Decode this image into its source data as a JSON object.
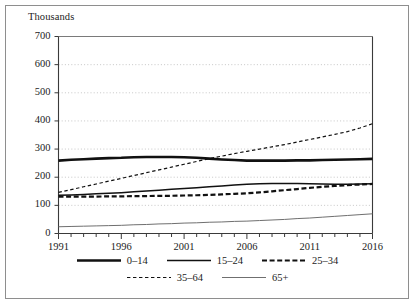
{
  "chart_data": {
    "type": "line",
    "title": "",
    "subtitle": "",
    "ylabel": "Thousands",
    "xlabel": "",
    "ylim": [
      0,
      700
    ],
    "xlim": [
      1991,
      2016
    ],
    "grid": "horizontal-dotted",
    "legend_position": "bottom-center",
    "y_ticks": [
      0,
      100,
      200,
      300,
      400,
      500,
      600,
      700
    ],
    "y_tick_labels": [
      "0",
      "100",
      "200",
      "300",
      "400",
      "500",
      "600",
      "700"
    ],
    "x_ticks_major": [
      1991,
      1996,
      2001,
      2006,
      2011,
      2016
    ],
    "x_tick_labels": [
      "1991",
      "1996",
      "2001",
      "2006",
      "2011",
      "2016"
    ],
    "x_minor_tick_interval": 1,
    "x": [
      1991,
      1992,
      1993,
      1994,
      1995,
      1996,
      1997,
      1998,
      1999,
      2000,
      2001,
      2002,
      2003,
      2004,
      2005,
      2006,
      2007,
      2008,
      2009,
      2010,
      2011,
      2012,
      2013,
      2014,
      2015,
      2016
    ],
    "series": [
      {
        "name": "0–14",
        "style": "solid",
        "width": 2.6,
        "color": "#111111",
        "values": [
          259,
          262,
          264,
          266,
          268,
          269,
          271,
          272,
          272,
          272,
          271,
          269,
          266,
          263,
          261,
          259,
          259,
          259,
          259,
          260,
          260,
          261,
          262,
          263,
          264,
          265
        ]
      },
      {
        "name": "15–24",
        "style": "solid",
        "width": 1.5,
        "color": "#111111",
        "values": [
          136,
          137,
          139,
          141,
          143,
          145,
          148,
          151,
          154,
          157,
          160,
          163,
          166,
          169,
          172,
          175,
          177,
          178,
          178,
          178,
          177,
          176,
          175,
          175,
          176,
          177
        ]
      },
      {
        "name": "25–34",
        "style": "dashed-thick",
        "width": 2.2,
        "color": "#111111",
        "values": [
          131,
          131,
          131,
          131,
          132,
          132,
          133,
          133,
          134,
          134,
          135,
          136,
          137,
          139,
          141,
          143,
          146,
          150,
          154,
          158,
          162,
          166,
          169,
          172,
          174,
          176
        ]
      },
      {
        "name": "35–64",
        "style": "dashed-fine",
        "width": 1.2,
        "color": "#111111",
        "values": [
          146,
          156,
          166,
          176,
          186,
          196,
          206,
          216,
          226,
          236,
          246,
          256,
          266,
          275,
          284,
          292,
          300,
          308,
          316,
          325,
          334,
          343,
          352,
          362,
          375,
          390
        ]
      },
      {
        "name": "65+",
        "style": "solid",
        "width": 1.0,
        "color": "#6f6f6f",
        "values": [
          24,
          25,
          26,
          27,
          28,
          29,
          31,
          32,
          34,
          35,
          37,
          38,
          40,
          41,
          43,
          44,
          46,
          48,
          50,
          53,
          55,
          58,
          61,
          64,
          67,
          70
        ]
      }
    ],
    "legend_rows": [
      [
        "0–14",
        "15–24",
        "25–34"
      ],
      [
        "35–64",
        "65+"
      ]
    ]
  },
  "axis": {
    "y_title": "Thousands"
  }
}
